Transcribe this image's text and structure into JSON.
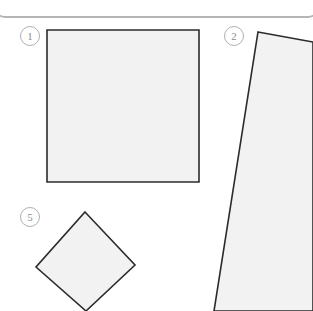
{
  "page": {
    "background_color": "#ffffff",
    "width": 313,
    "height": 311
  },
  "top_panel": {
    "name": "panel-bottom-edge",
    "border_color": "#c9c9c9",
    "shadow_color": "#b5b5b5"
  },
  "markers": [
    {
      "id": "marker-1",
      "label": "1",
      "x": 20,
      "y": 26
    },
    {
      "id": "marker-2",
      "label": "2",
      "x": 224,
      "y": 26
    },
    {
      "id": "marker-5",
      "label": "5",
      "x": 20,
      "y": 207
    }
  ],
  "shapes": {
    "stroke_color": "#2b2b2b",
    "fill_color": "#f2f2f2",
    "stroke_width": 1.6,
    "items": [
      {
        "id": "shape-1",
        "marker": "1",
        "type": "square",
        "points": "47,30 199,30 199,182 47,182"
      },
      {
        "id": "shape-2",
        "marker": "2",
        "type": "quadrilateral",
        "points": "258,32 313,42 313,311 214,311"
      },
      {
        "id": "shape-5",
        "marker": "5",
        "type": "diamond",
        "points": "85,212 135,265 86,311 36,267"
      }
    ]
  }
}
